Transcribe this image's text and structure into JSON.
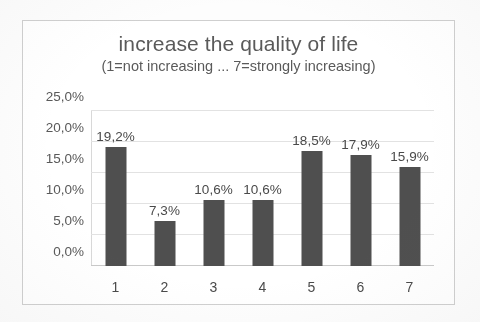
{
  "chart_data": {
    "type": "bar",
    "title": "increase the quality of life",
    "subtitle": "(1=not increasing ... 7=strongly increasing)",
    "xlabel": "",
    "ylabel": "",
    "categories": [
      "1",
      "2",
      "3",
      "4",
      "5",
      "6",
      "7"
    ],
    "values": [
      19.2,
      7.3,
      10.6,
      10.6,
      18.5,
      17.9,
      15.9
    ],
    "value_labels": [
      "19,2%",
      "7,3%",
      "10,6%",
      "10,6%",
      "18,5%",
      "17,9%",
      "15,9%"
    ],
    "ylim": [
      0,
      25
    ],
    "ytick_values": [
      0,
      5,
      10,
      15,
      20,
      25
    ],
    "ytick_labels": [
      "0,0%",
      "5,0%",
      "10,0%",
      "15,0%",
      "20,0%",
      "25,0%"
    ],
    "grid": true,
    "legend": false,
    "legend_position": "none",
    "decimal_separator": ",",
    "unit": "%",
    "colors": {
      "bar": "#4f4f4f",
      "gridline": "#e2e2e2",
      "axis": "#c9c9c9",
      "text": "#595959",
      "title_text": "#5a5a5a",
      "frame_border": "#cfcfcf",
      "background": "#ffffff"
    }
  }
}
